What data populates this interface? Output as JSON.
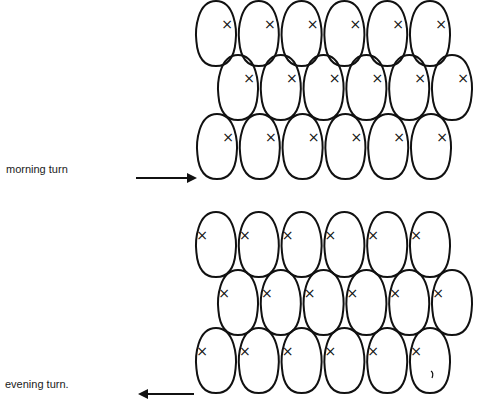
{
  "labels": {
    "morning": "morning turn",
    "evening": "evening turn."
  },
  "diagram": {
    "columns": 6,
    "rows_per_group": 3,
    "groups": [
      {
        "name": "morning",
        "x_mark_side": "right",
        "arrow_direction": "right"
      },
      {
        "name": "evening",
        "x_mark_side": "left",
        "arrow_direction": "left"
      }
    ],
    "mark_glyph": "×",
    "stroke_color": "#111111"
  }
}
